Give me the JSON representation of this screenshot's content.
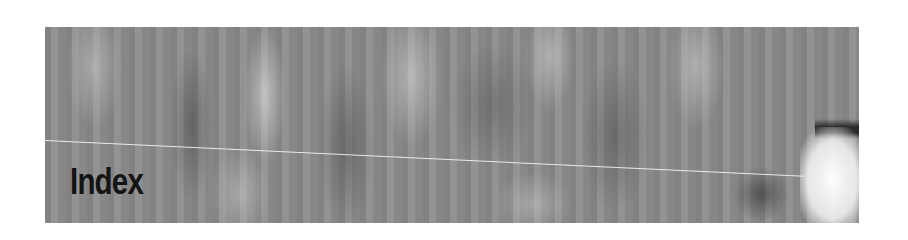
{
  "heading": {
    "title": "Index"
  },
  "banner": {
    "style": "grey-textured-photo",
    "colors": {
      "base": "#8c8c8c",
      "text": "#141414",
      "line": "#f5f5f5",
      "page_background": "#ffffff"
    }
  }
}
